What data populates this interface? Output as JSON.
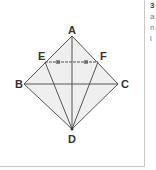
{
  "diagram": {
    "points": {
      "A": {
        "label": "A",
        "x": 72,
        "y": 36
      },
      "B": {
        "label": "B",
        "x": 24,
        "y": 84
      },
      "C": {
        "label": "C",
        "x": 118,
        "y": 84
      },
      "D": {
        "label": "D",
        "x": 72,
        "y": 129
      },
      "E": {
        "label": "E",
        "x": 45,
        "y": 62
      },
      "F": {
        "label": "F",
        "x": 98,
        "y": 62
      }
    },
    "edges": [
      [
        "A",
        "B"
      ],
      [
        "A",
        "C"
      ],
      [
        "B",
        "D"
      ],
      [
        "C",
        "D"
      ],
      [
        "A",
        "D"
      ],
      [
        "B",
        "C"
      ],
      [
        "E",
        "D"
      ],
      [
        "F",
        "D"
      ]
    ],
    "dashed_edges": [
      [
        "E",
        "F"
      ]
    ],
    "fill_color": "#efefef",
    "line_color": "#555555"
  },
  "side_text": {
    "lines": [
      "3",
      "a",
      "n",
      "l"
    ]
  }
}
